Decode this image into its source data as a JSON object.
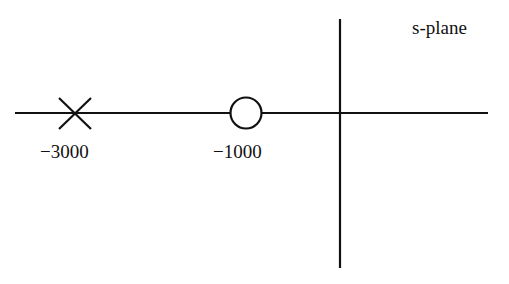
{
  "diagram": {
    "title": "s-plane",
    "type": "pole-zero plot",
    "axes": {
      "real_axis": "horizontal",
      "imaginary_axis": "vertical"
    },
    "poles": [
      {
        "value": -3000,
        "label": "−3000",
        "symbol": "x-mark"
      }
    ],
    "zeros": [
      {
        "value": -1000,
        "label": "−1000",
        "symbol": "circle"
      }
    ],
    "colors": {
      "stroke": "#111111",
      "background": "#ffffff"
    }
  }
}
